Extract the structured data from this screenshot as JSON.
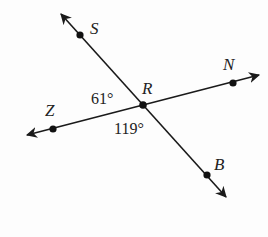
{
  "diagram": {
    "type": "intersecting-lines",
    "stroke_color": "#1a1a1a",
    "points": {
      "S": {
        "label": "S",
        "x": 80,
        "y": 35
      },
      "R": {
        "label": "R",
        "x": 143,
        "y": 105
      },
      "N": {
        "label": "N",
        "x": 233,
        "y": 83
      },
      "Z": {
        "label": "Z",
        "x": 53,
        "y": 129
      },
      "B": {
        "label": "B",
        "x": 207,
        "y": 175
      }
    },
    "lines": [
      {
        "name": "line-SB",
        "through": [
          "S",
          "R",
          "B"
        ]
      },
      {
        "name": "line-ZN",
        "through": [
          "Z",
          "R",
          "N"
        ]
      }
    ],
    "angles": {
      "angle_SRZ": {
        "label": "61°",
        "vertex": "R"
      },
      "angle_ZRB": {
        "label": "119°",
        "vertex": "R"
      }
    }
  }
}
